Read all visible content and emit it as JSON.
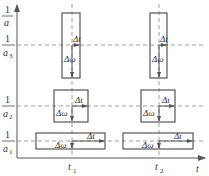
{
  "diagram": {
    "type": "time-frequency resolution tiles",
    "y_axis": {
      "label_num": "1",
      "label_den": "a"
    },
    "x_axis": {
      "label": "t"
    },
    "x_ticks": [
      {
        "label": "t",
        "sub": "1"
      },
      {
        "label": "t",
        "sub": "2"
      }
    ],
    "y_levels": [
      {
        "num": "1",
        "den": "a",
        "sub": "3"
      },
      {
        "num": "1",
        "den": "a",
        "sub": "2"
      },
      {
        "num": "1",
        "den": "a",
        "sub": "1"
      }
    ],
    "tile_labels": {
      "dt": "Δt",
      "dw": "Δω"
    },
    "colors": {
      "line": "#555555",
      "dash": "#888888",
      "text": "#333333"
    }
  }
}
